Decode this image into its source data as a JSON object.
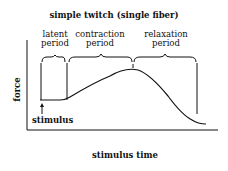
{
  "diagram": {
    "title": "simple twitch (single fiber)",
    "phases": [
      {
        "line1": "latent",
        "line2": "period"
      },
      {
        "line1": "contraction",
        "line2": "period"
      },
      {
        "line1": "relaxation",
        "line2": "period"
      }
    ],
    "y_axis_label": "force",
    "x_axis_label": "stimulus time",
    "stimulus_label": "stimulus",
    "line_color": "#111111"
  }
}
